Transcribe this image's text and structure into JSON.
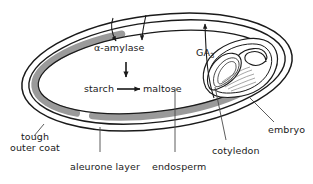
{
  "diagram": {
    "background_color": "#ffffff",
    "line_color": "#1a1a1a",
    "aleurone_fill": "#9a9a9a",
    "text_color": "#1a1a1a"
  },
  "labels": {
    "alpha_amylase": "α-amylase",
    "starch": "starch",
    "maltose": "maltose",
    "ga3": "GA",
    "ga3_subscript": "3",
    "tough_outer_coat": "tough\nouter coat",
    "tough_outer_coat_line1": "tough",
    "tough_outer_coat_line2": "outer coat",
    "aleurone_layer": "aleurone layer",
    "endosperm": "endosperm",
    "cotyledon": "cotyledon",
    "embryo": "embryo"
  },
  "structures": [
    {
      "name": "tough-outer-coat",
      "label": "tough outer coat"
    },
    {
      "name": "aleurone-layer",
      "label": "aleurone layer"
    },
    {
      "name": "endosperm",
      "label": "endosperm"
    },
    {
      "name": "cotyledon",
      "label": "cotyledon"
    },
    {
      "name": "embryo",
      "label": "embryo"
    }
  ],
  "reactions": [
    {
      "name": "starch-to-maltose",
      "substrate": "starch",
      "product": "maltose",
      "enzyme": "α-amylase"
    }
  ],
  "signals": [
    {
      "name": "ga3-signal",
      "from": "embryo",
      "to": "aleurone-layer",
      "label": "GA3"
    },
    {
      "name": "amylase-release",
      "from": "aleurone-layer",
      "to": "endosperm",
      "label": "α-amylase"
    }
  ]
}
